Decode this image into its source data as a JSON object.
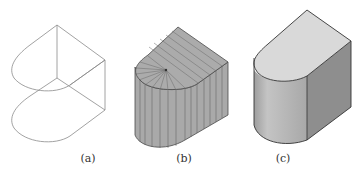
{
  "figure": {
    "panels": [
      {
        "id": "a",
        "label": "(a)",
        "style": "wireframe"
      },
      {
        "id": "b",
        "label": "(b)",
        "style": "faceted-shaded"
      },
      {
        "id": "c",
        "label": "(c)",
        "style": "smooth-shaded"
      }
    ],
    "colors": {
      "wire": "#8a8a8a",
      "facet_fill": "#a9a9a9",
      "facet_line": "#5a5a5a",
      "top_face": "#d8d8d8",
      "front_curved": "#b5b5b5",
      "right_face": "#8c8c8c",
      "edge": "#333333"
    }
  }
}
